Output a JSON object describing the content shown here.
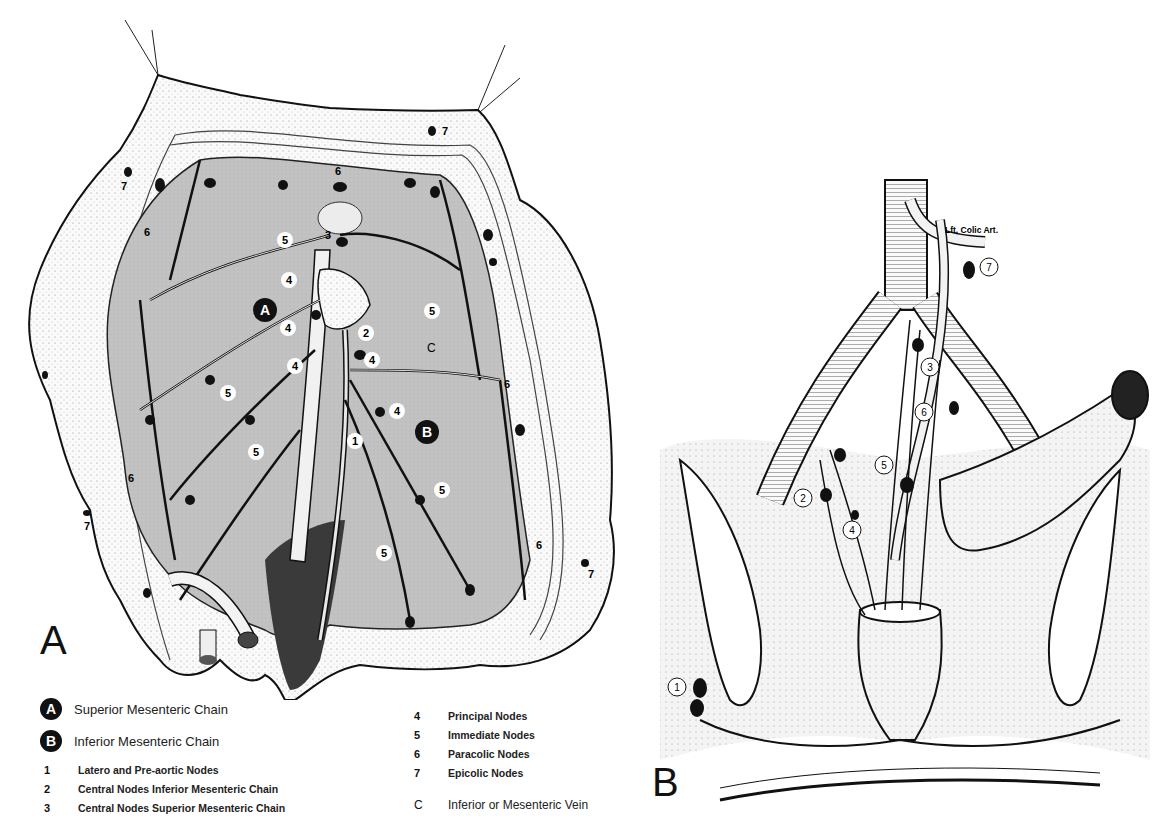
{
  "figure_a": {
    "panel_letter": "A",
    "chain_markers": [
      {
        "id": "A",
        "label": "A"
      },
      {
        "id": "B",
        "label": "B"
      }
    ],
    "node_labels": [
      "1",
      "2",
      "3",
      "4",
      "4",
      "4",
      "4",
      "4",
      "5",
      "5",
      "5",
      "5",
      "5",
      "5",
      "6",
      "6",
      "6",
      "6",
      "6",
      "7",
      "7",
      "7",
      "7"
    ],
    "vein_label": "C"
  },
  "figure_b": {
    "panel_letter": "B",
    "artery_label": "Lft. Colic Art.",
    "node_labels": [
      "1",
      "2",
      "3",
      "4",
      "5",
      "6",
      "7"
    ]
  },
  "legend": {
    "chains": [
      {
        "marker": "A",
        "label": "Superior Mesenteric Chain"
      },
      {
        "marker": "B",
        "label": "Inferior Mesenteric Chain"
      }
    ],
    "nodes_left": [
      {
        "number": "1",
        "label": "Latero and Pre-aortic Nodes"
      },
      {
        "number": "2",
        "label": "Central Nodes Inferior Mesenteric Chain"
      },
      {
        "number": "3",
        "label": "Central Nodes Superior Mesenteric Chain"
      }
    ],
    "nodes_right": [
      {
        "number": "4",
        "label": "Principal Nodes"
      },
      {
        "number": "5",
        "label": "Immediate Nodes"
      },
      {
        "number": "6",
        "label": "Paracolic Nodes"
      },
      {
        "number": "7",
        "label": "Epicolic Nodes"
      }
    ],
    "vein": {
      "marker": "C",
      "label": "Inferior or Mesenteric Vein"
    }
  },
  "colors": {
    "ink": "#111111",
    "mesentery_gray": "#bdbdbd",
    "dark_region": "#3a3a3a",
    "paper": "#ffffff"
  }
}
